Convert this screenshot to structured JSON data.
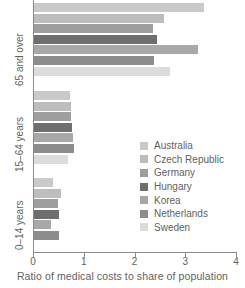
{
  "chart_data": {
    "type": "bar",
    "orientation": "horizontal",
    "title": "",
    "xlabel": "Ratio of medical costs to share of population",
    "ylabel": "",
    "xlim": [
      0,
      4
    ],
    "xticks": [
      0,
      1,
      2,
      3,
      4
    ],
    "xticklabels": [
      "0",
      "1",
      "2",
      "3",
      "4"
    ],
    "grid": false,
    "legend_position": "center-right",
    "categories": [
      "0–14 years",
      "15–64 years",
      "65 and over"
    ],
    "series": [
      {
        "name": "Australia",
        "color": "#c9c9c9",
        "values": [
          0.4,
          0.72,
          3.37
        ]
      },
      {
        "name": "Czech Republic",
        "color": "#bdbdbd",
        "values": [
          0.56,
          0.74,
          2.58
        ]
      },
      {
        "name": "Germany",
        "color": "#9e9e9e",
        "values": [
          0.5,
          0.74,
          2.36
        ]
      },
      {
        "name": "Hungary",
        "color": "#6e6e6e",
        "values": [
          0.52,
          0.76,
          2.44
        ]
      },
      {
        "name": "Korea",
        "color": "#a8a8a8",
        "values": [
          0.36,
          0.78,
          3.25
        ]
      },
      {
        "name": "Netherlands",
        "color": "#8c8c8c",
        "values": [
          0.52,
          0.8,
          2.38
        ]
      },
      {
        "name": "Sweden",
        "color": "#dcdcdc",
        "values": [
          0.0,
          0.68,
          2.7
        ]
      }
    ]
  },
  "legend": {
    "items": [
      {
        "label": "Australia"
      },
      {
        "label": "Czech Republic"
      },
      {
        "label": "Germany"
      },
      {
        "label": "Hungary"
      },
      {
        "label": "Korea"
      },
      {
        "label": "Netherlands"
      },
      {
        "label": "Sweden"
      }
    ]
  }
}
